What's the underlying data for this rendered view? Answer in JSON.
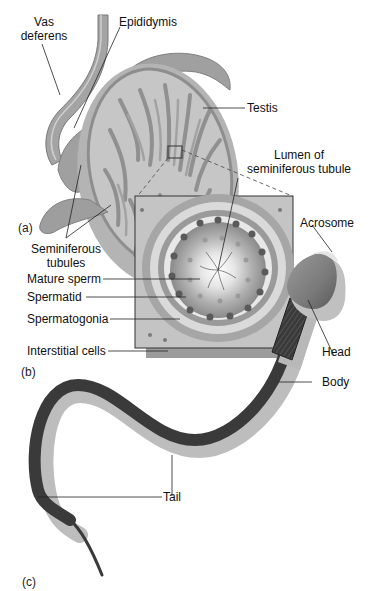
{
  "figure": {
    "panels": [
      {
        "id": "a",
        "label": "(a)"
      },
      {
        "id": "b",
        "label": "(b)"
      },
      {
        "id": "c",
        "label": "(c)"
      }
    ],
    "labels": {
      "vas_deferens_line1": "Vas",
      "vas_deferens_line2": "deferens",
      "epididymis": "Epididymis",
      "testis": "Testis",
      "seminiferous_line1": "Seminiferous",
      "seminiferous_line2": "tubules",
      "lumen_line1": "Lumen of",
      "lumen_line2": "seminiferous tubule",
      "mature_sperm": "Mature sperm",
      "spermatid": "Spermatid",
      "spermatogonia": "Spermatogonia",
      "interstitial_cells": "Interstitial cells",
      "acrosome": "Acrosome",
      "head": "Head",
      "body": "Body",
      "tail": "Tail"
    },
    "colors": {
      "background": "#ffffff",
      "tissue_light": "#c8c8c8",
      "tissue_mid": "#a8a8a8",
      "tissue_dark": "#7a7a7a",
      "tail_dark": "#3a3a3a",
      "shadow": "#bdbdbd",
      "leader_line": "#222222"
    }
  }
}
